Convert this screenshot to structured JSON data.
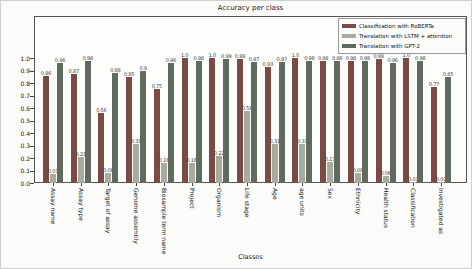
{
  "figure": {
    "xlabel": "Classes"
  },
  "chart_data": {
    "type": "bar",
    "xlabel": "Classes",
    "ylabel": "",
    "ylim": [
      0,
      1.35
    ],
    "yticks": [
      0.0,
      0.1,
      0.2,
      0.3,
      0.4,
      0.5,
      0.6,
      0.7,
      0.8,
      0.9,
      1.0
    ],
    "grid": false,
    "bar_value_labels": true,
    "legend_position": "upper right",
    "categories": [
      "Assay name",
      "Assay type",
      "Target of assay",
      "Genome assembly",
      "Biosample term name",
      "Project",
      "Organism",
      "Life stage",
      "Age",
      "age units",
      "Sex",
      "Ethnicity",
      "Health status",
      "Classification",
      "Investigated as"
    ],
    "series": [
      {
        "name": "Classification with RoBERTa",
        "color": "#7a4b44",
        "values": [
          0.86,
          0.87,
          0.56,
          0.85,
          0.75,
          1.0,
          1.0,
          0.99,
          0.93,
          1.0,
          0.98,
          0.98,
          0.99,
          1.0,
          0.77
        ]
      },
      {
        "name": "Translation with LSTM + attention",
        "color": "#a9ab9e",
        "values": [
          0.07,
          0.21,
          0.08,
          0.31,
          0.16,
          0.16,
          0.22,
          0.58,
          0.31,
          0.31,
          0.17,
          0.08,
          0.06,
          0.01,
          0.01
        ]
      },
      {
        "name": "Translation with GPT-2",
        "color": "#5f6b5e",
        "values": [
          0.96,
          0.98,
          0.88,
          0.9,
          0.96,
          0.98,
          0.99,
          0.97,
          0.97,
          0.98,
          0.98,
          0.98,
          0.96,
          0.98,
          0.85
        ]
      }
    ]
  }
}
